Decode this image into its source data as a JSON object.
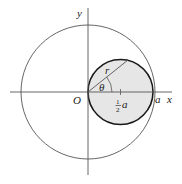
{
  "diagram": {
    "labels": {
      "x_axis": "x",
      "y_axis": "y",
      "origin": "O",
      "point_a": "a",
      "radius": "r",
      "angle": "θ",
      "center_frac_num": "1",
      "center_frac_den": "2",
      "center_var": "a"
    },
    "colors": {
      "small_circle_fill": "#e6e6e6",
      "small_circle_stroke": "#1a1a1a",
      "large_circle_stroke": "#555555",
      "axis_stroke": "#555555"
    }
  }
}
